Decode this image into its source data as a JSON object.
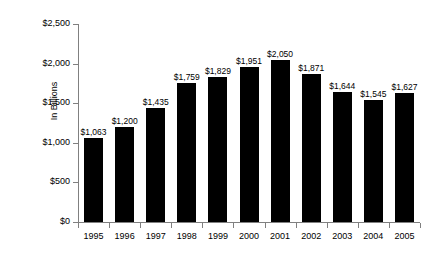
{
  "chart_data": {
    "type": "bar",
    "title": "",
    "xlabel": "",
    "ylabel": "In Billions",
    "categories": [
      "1995",
      "1996",
      "1997",
      "1998",
      "1999",
      "2000",
      "2001",
      "2002",
      "2003",
      "2004",
      "2005"
    ],
    "values": [
      1063,
      1200,
      1435,
      1759,
      1829,
      1951,
      2050,
      1871,
      1644,
      1545,
      1627
    ],
    "data_labels": [
      "$1,063",
      "$1,200",
      "$1,435",
      "$1,759",
      "$1,829",
      "$1,951",
      "$2,050",
      "$1,871",
      "$1,644",
      "$1,545",
      "$1,627"
    ],
    "ylim": [
      0,
      2500
    ],
    "ytick_values": [
      0,
      500,
      1000,
      1500,
      2000,
      2500
    ],
    "ytick_labels": [
      "$0",
      "$500",
      "$1,000",
      "$1,500",
      "$2,000",
      "$2,500"
    ],
    "grid": false,
    "legend": false,
    "legend_position": "none",
    "bar_color": "#000000",
    "axis_color": "#808080",
    "background_color": "#ffffff"
  }
}
